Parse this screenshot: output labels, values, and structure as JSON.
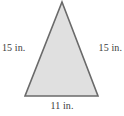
{
  "figure": {
    "kind": "geometry-figure",
    "shape": "isosceles-triangle",
    "background_color": "#ffffff",
    "fill_color": "#e0e0e0",
    "stroke_color": "#6a6a6a",
    "label_color": "#3b3b3b",
    "labels": {
      "left_side": "15 in.",
      "right_side": "15 in.",
      "base": "11 in."
    },
    "vertices": {
      "apex": "62,2",
      "base_left": "25,96",
      "base_right": "98,96"
    },
    "polygon_points": "62,2 98,96 25,96"
  }
}
